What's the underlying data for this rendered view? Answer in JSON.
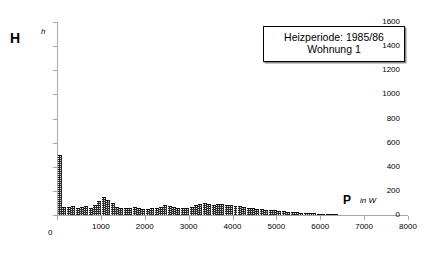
{
  "legend": {
    "line1": "Heizperiode: 1985/86",
    "line2": "Wohnung 1"
  },
  "axes": {
    "y_title": "H",
    "y_unit": "h",
    "x_title": "P",
    "x_unit": "in W"
  },
  "chart_data": {
    "type": "bar",
    "title": "",
    "subtitle": "",
    "xlabel": "P in W",
    "ylabel": "H h",
    "xlim": [
      0,
      8000
    ],
    "ylim": [
      0,
      1600
    ],
    "grid": false,
    "legend_position": "top-right",
    "bar_color": "#2b2b2b",
    "bin_width": 100,
    "xticks": [
      0,
      1000,
      2000,
      3000,
      4000,
      5000,
      6000,
      7000,
      8000
    ],
    "xtick_labels": [
      "0",
      "1000",
      "2000",
      "3000",
      "4000",
      "5000",
      "6000",
      "7000",
      "8000"
    ],
    "yticks": [
      0,
      200,
      400,
      600,
      800,
      1000,
      1200,
      1400,
      1600
    ],
    "ytick_labels": [
      "0",
      "200",
      "400",
      "600",
      "800",
      "1000",
      "1200",
      "1400",
      "1600"
    ],
    "x": [
      50,
      150,
      250,
      350,
      450,
      550,
      650,
      750,
      850,
      950,
      1050,
      1150,
      1250,
      1350,
      1450,
      1550,
      1650,
      1750,
      1850,
      1950,
      2050,
      2150,
      2250,
      2350,
      2450,
      2550,
      2650,
      2750,
      2850,
      2950,
      3050,
      3150,
      3250,
      3350,
      3450,
      3550,
      3650,
      3750,
      3850,
      3950,
      4050,
      4150,
      4250,
      4350,
      4450,
      4550,
      4650,
      4750,
      4850,
      4950,
      5050,
      5150,
      5250,
      5350,
      5450,
      5550,
      5650,
      5750,
      5850,
      5950,
      6050,
      6150,
      6250,
      6350,
      6450,
      6550,
      6650,
      6750,
      6850,
      6950,
      7050,
      7150,
      7250,
      7350,
      7450,
      7550,
      7650,
      7750,
      7850,
      7950
    ],
    "values": [
      500,
      70,
      68,
      72,
      60,
      66,
      74,
      62,
      86,
      120,
      148,
      128,
      96,
      66,
      62,
      58,
      60,
      64,
      56,
      52,
      54,
      58,
      62,
      70,
      80,
      74,
      64,
      60,
      58,
      62,
      70,
      84,
      92,
      96,
      90,
      86,
      88,
      90,
      84,
      80,
      78,
      72,
      66,
      62,
      58,
      54,
      50,
      44,
      40,
      38,
      34,
      30,
      28,
      24,
      22,
      20,
      18,
      16,
      14,
      12,
      10,
      6,
      4,
      2,
      0,
      0,
      0,
      0,
      0,
      0,
      0,
      0,
      0,
      0,
      0,
      0,
      0,
      0,
      0,
      0
    ],
    "series": [
      {
        "name": "Häufigkeit",
        "values": [
          500,
          70,
          68,
          72,
          60,
          66,
          74,
          62,
          86,
          120,
          148,
          128,
          96,
          66,
          62,
          58,
          60,
          64,
          56,
          52,
          54,
          58,
          62,
          70,
          80,
          74,
          64,
          60,
          58,
          62,
          70,
          84,
          92,
          96,
          90,
          86,
          88,
          90,
          84,
          80,
          78,
          72,
          66,
          62,
          58,
          54,
          50,
          44,
          40,
          38,
          34,
          30,
          28,
          24,
          22,
          20,
          18,
          16,
          14,
          12,
          10,
          6,
          4,
          2,
          0,
          0,
          0,
          0,
          0,
          0,
          0,
          0,
          0,
          0,
          0,
          0,
          0,
          0,
          0,
          0
        ]
      }
    ],
    "annotations": [
      "Heizperiode: 1985/86",
      "Wohnung 1"
    ]
  }
}
